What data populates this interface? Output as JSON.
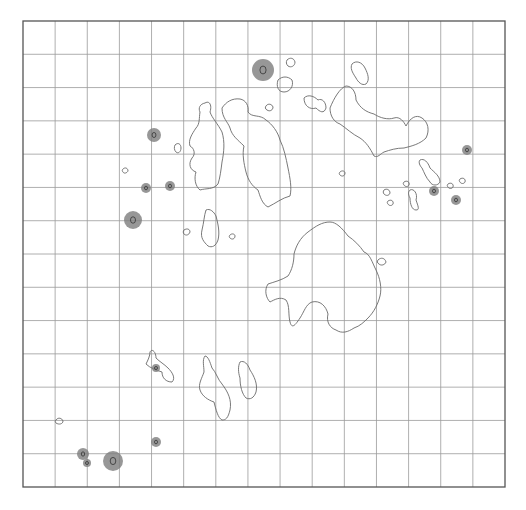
{
  "figure": {
    "width": 526,
    "height": 510,
    "grid": {
      "left": 23,
      "top": 21,
      "right": 505,
      "bottom": 487,
      "columns": 15,
      "rows": 14,
      "line_color": "#9a9a9a",
      "frame_color": "#555555"
    },
    "colors": {
      "contour": "#6a6a6a",
      "blob_fill": "#7d7d7d",
      "blob_core": "#333333"
    },
    "contours": [
      {
        "id": "west-large",
        "d": "M205,103 C210,100 212,106 210,112 C212,118 218,124 222,132 C225,142 224,152 222,162 C221,170 220,178 218,184 C213,190 206,188 200,190 C195,186 194,178 196,172 C190,170 188,164 192,158 C196,154 194,148 190,146 C188,140 192,134 196,128 C200,124 199,118 200,112 C198,108 200,104 205,103 Z"
      },
      {
        "id": "central-north",
        "d": "M222,108 C226,102 232,98 240,99 C246,100 249,106 248,112 C252,118 260,114 266,120 C272,124 278,132 280,140 C284,148 286,158 288,168 C290,178 292,188 290,196 C282,198 276,203 268,207 C262,204 260,196 258,190 C252,186 248,180 246,172 C244,164 242,154 244,146 C238,140 232,136 230,128 C228,122 222,118 222,108 Z"
      },
      {
        "id": "northeast-large",
        "d": "M330,108 C334,98 340,88 346,86 C352,86 356,92 356,100 C360,108 366,112 374,114 C380,118 388,120 394,118 C400,116 404,122 406,126 C410,118 416,114 422,118 C428,122 430,130 426,138 C420,144 412,146 404,148 C396,148 390,150 384,152 C380,154 378,158 374,156 C370,148 366,142 360,138 C352,134 346,128 340,124 C334,122 330,116 330,108 Z"
      },
      {
        "id": "northeast-islet",
        "d": "M352,64 C356,60 362,62 365,68 C368,74 370,80 366,84 C362,86 358,82 356,78 C352,72 350,68 352,64 Z"
      },
      {
        "id": "ne-small-1",
        "d": "M304,98 C308,94 314,96 318,100 C322,98 326,102 326,108 C324,114 320,112 316,108 C310,110 304,106 304,98 Z"
      },
      {
        "id": "ne-small-2",
        "d": "M278,80 C282,76 288,76 292,80 C294,86 290,92 284,92 C278,92 276,86 278,80 Z"
      },
      {
        "id": "ne-dot-1",
        "d": "M287,60 C290,57 294,58 295,62 C295,66 291,68 288,66 C286,64 286,62 287,60 Z"
      },
      {
        "id": "ne-dot-2",
        "d": "M266,106 C268,103 272,104 273,107 C273,110 270,112 267,110 C265,109 265,107 266,106 Z"
      },
      {
        "id": "center-south",
        "d": "M330,222 C336,222 342,228 348,236 C354,240 360,246 364,252 C370,254 372,262 376,270 C380,278 382,288 380,296 C378,304 374,312 368,318 C364,322 360,326 354,328 C348,332 342,334 336,330 C330,328 326,322 328,314 C326,306 320,300 312,302 C306,304 304,312 300,318 C296,324 292,330 290,322 C288,314 290,306 286,300 C280,296 274,300 270,302 C266,298 264,290 268,284 C274,282 282,280 288,276 C292,270 294,262 294,254 C296,246 300,238 308,232 C316,226 322,222 330,222 Z"
      },
      {
        "id": "center-south-dot",
        "d": "M378,260 C381,257 385,258 386,262 C385,265 381,266 379,264 C377,263 377,261 378,260 Z"
      },
      {
        "id": "mid-islet",
        "d": "M206,210 C210,208 214,212 216,216 C218,224 220,232 218,240 C216,246 212,248 208,246 C204,242 200,238 202,230 C204,222 204,216 206,210 Z"
      },
      {
        "id": "mid-dot-1",
        "d": "M184,230 C187,228 190,229 190,232 C189,235 186,236 184,234 C183,233 183,231 184,230 Z"
      },
      {
        "id": "mid-dot-2",
        "d": "M230,235 C232,233 235,234 235,236 C235,239 232,240 230,238 C229,237 229,236 230,235 Z"
      },
      {
        "id": "west-dot",
        "d": "M175,145 C178,142 181,144 181,148 C181,152 178,154 176,152 C174,150 174,147 175,145 Z"
      },
      {
        "id": "far-west-dot",
        "d": "M123,169 C125,167 128,168 128,171 C127,173 124,174 123,172 C122,171 122,170 123,169 Z"
      },
      {
        "id": "south-islet-1",
        "d": "M150,352 C152,348 156,352 156,358 C160,362 164,364 168,368 C172,372 176,378 172,382 C166,382 162,378 162,372 C156,370 150,368 146,364 C148,360 150,356 150,352 Z"
      },
      {
        "id": "south-islet-2",
        "d": "M205,356 C208,356 210,362 212,368 C216,372 218,380 222,384 C228,392 232,400 230,410 C228,418 226,420 222,420 C218,418 216,410 214,402 C208,400 202,396 200,390 C198,384 202,378 204,372 C204,366 202,360 205,356 Z"
      },
      {
        "id": "south-islet-3",
        "d": "M240,362 C244,360 248,364 250,370 C254,376 258,384 256,392 C254,398 250,400 246,398 C242,394 240,386 240,378 C238,372 238,366 240,362 Z"
      },
      {
        "id": "sw-dot",
        "d": "M56,420 C58,417 62,418 63,421 C63,424 59,425 56,423 C55,422 55,421 56,420 Z"
      },
      {
        "id": "east-cluster-1",
        "d": "M420,160 C424,158 428,162 430,168 C434,172 440,176 440,182 C438,186 432,186 430,182 C426,178 424,172 422,168 C420,166 418,162 420,160 Z"
      },
      {
        "id": "east-cluster-2",
        "d": "M410,190 C414,188 418,194 416,200 C418,206 420,210 416,210 C412,210 410,204 410,198 C408,194 408,192 410,190 Z"
      },
      {
        "id": "east-dot-1",
        "d": "M384,190 C387,188 390,190 390,193 C389,196 386,196 384,194 C383,193 383,191 384,190 Z"
      },
      {
        "id": "east-dot-2",
        "d": "M388,201 C391,199 394,201 393,204 C392,206 389,206 388,204 C387,203 387,202 388,201 Z"
      },
      {
        "id": "east-dot-3",
        "d": "M404,182 C407,180 410,182 409,185 C408,187 405,187 404,185 C403,184 403,183 404,182 Z"
      },
      {
        "id": "east-dot-4",
        "d": "M448,184 C451,182 454,184 453,187 C452,189 449,189 448,187 C447,186 447,185 448,184 Z"
      },
      {
        "id": "east-dot-5",
        "d": "M460,179 C463,177 466,179 465,182 C464,184 461,184 460,182 C459,181 459,180 460,179 Z"
      },
      {
        "id": "mid-east-dot",
        "d": "M340,172 C342,170 345,171 345,173 C345,176 342,177 340,175 C339,174 339,173 340,172 Z"
      }
    ],
    "markers": [
      {
        "id": "m1",
        "cx": 263,
        "cy": 70,
        "r": 11
      },
      {
        "id": "m2",
        "cx": 154,
        "cy": 135,
        "r": 7
      },
      {
        "id": "m3",
        "cx": 146,
        "cy": 188,
        "r": 5
      },
      {
        "id": "m4",
        "cx": 170,
        "cy": 186,
        "r": 5
      },
      {
        "id": "m5",
        "cx": 133,
        "cy": 220,
        "r": 9
      },
      {
        "id": "m6",
        "cx": 467,
        "cy": 150,
        "r": 5
      },
      {
        "id": "m7",
        "cx": 434,
        "cy": 191,
        "r": 5
      },
      {
        "id": "m8",
        "cx": 456,
        "cy": 200,
        "r": 5
      },
      {
        "id": "m9",
        "cx": 156,
        "cy": 368,
        "r": 4
      },
      {
        "id": "m10",
        "cx": 156,
        "cy": 442,
        "r": 5
      },
      {
        "id": "m11",
        "cx": 83,
        "cy": 454,
        "r": 6
      },
      {
        "id": "m12",
        "cx": 87,
        "cy": 463,
        "r": 4
      },
      {
        "id": "m13",
        "cx": 113,
        "cy": 461,
        "r": 10
      }
    ]
  }
}
